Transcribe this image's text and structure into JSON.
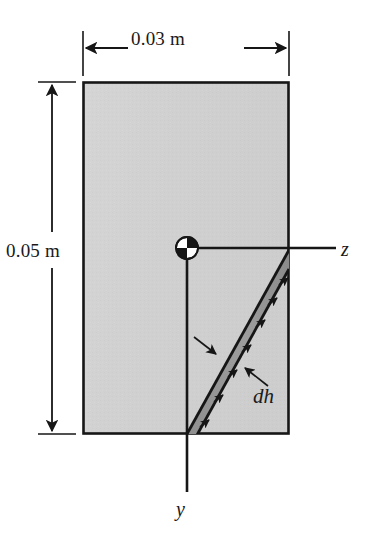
{
  "figure": {
    "kind": "engineering-cross-section-diagram"
  },
  "dimensions": {
    "width_label": "0.03 m",
    "height_label": "0.05 m"
  },
  "axes": {
    "horizontal_label": "z",
    "vertical_label": "y"
  },
  "annotations": {
    "strip_thickness_label": "dh"
  },
  "colors": {
    "section_fill": "#d2d2d2",
    "strip_fill": "#9a9a9a",
    "outline": "#161616",
    "axis": "#161616",
    "text": "#1a1a1a",
    "background": "#ffffff"
  },
  "geometry": {
    "rect_left": 83,
    "rect_top": 82,
    "rect_right": 289,
    "rect_bottom": 434,
    "origin_x": 187,
    "origin_y": 248,
    "z_axis_end_x": 336,
    "y_axis_end_y": 492,
    "strip_top_x": 289,
    "strip_top_y": 250,
    "strip_bottom_x": 187,
    "strip_bottom_y": 434,
    "marker_radius": 11
  }
}
